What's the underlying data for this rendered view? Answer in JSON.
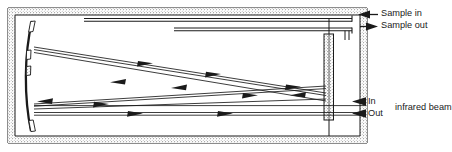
{
  "diagram": {
    "type": "optical-multipass-gas-cell",
    "background_color": "#ffffff",
    "line_color": "#1a1a1a",
    "wall_fill_color": "#f2f2f2",
    "mirror_fill_color": "#ffffff",
    "labels": {
      "sample_in": "Sample in",
      "sample_out": "Sample out",
      "beam_in": "In",
      "beam_out": "Out",
      "infrared_beam": "infrared beam"
    },
    "icons": {
      "sample_in_arrow": "arrow-left-icon",
      "sample_out_arrow": "arrow-right-icon",
      "beam_in_arrow": "arrow-left-icon",
      "beam_out_arrow": "arrow-left-icon",
      "beam_path_arrow": "arrow-head-icon"
    },
    "components": {
      "housing": "double-walled-stippled-enclosure",
      "left_mirror": "concave-curved-mirror",
      "right_mirror": "vertical-flat-mirror",
      "sample_pipes": "horizontal-inlet-outlet-tubes",
      "beam_paths": "folded-multipass-optical-rays"
    }
  }
}
